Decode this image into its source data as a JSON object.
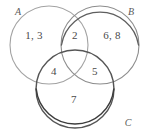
{
  "figure": {
    "type": "venn-diagram-3-set",
    "width": 148,
    "height": 134,
    "background_color": "#ffffff"
  },
  "sets": [
    {
      "name": "set-a",
      "label": "A",
      "label_x": 18,
      "label_y": 11,
      "cx": 49,
      "cy": 45,
      "r": 39,
      "stroke_color": "#a3a3a3",
      "stroke_width": 1.1
    },
    {
      "name": "set-b",
      "label": "B",
      "label_x": 131,
      "label_y": 11,
      "cx": 100,
      "cy": 45,
      "r": 39,
      "stroke_color": "#8d8d8d",
      "stroke_width": 1.1
    },
    {
      "name": "set-c",
      "label": "C",
      "label_x": 128,
      "label_y": 122,
      "cx": 75,
      "cy": 89,
      "r": 39,
      "stroke_color": "#565656",
      "stroke_width": 1.4
    }
  ],
  "regions": [
    {
      "name": "region-a-only",
      "region": "A only",
      "value": "1, 3",
      "x": 34,
      "y": 35
    },
    {
      "name": "region-a-and-b",
      "region": "A ∩ B",
      "value": "2",
      "x": 75,
      "y": 35
    },
    {
      "name": "region-b-only",
      "region": "B only",
      "value": "6, 8",
      "x": 112,
      "y": 35
    },
    {
      "name": "region-a-and-c",
      "region": "A ∩ C",
      "value": "4",
      "x": 54,
      "y": 71
    },
    {
      "name": "region-b-and-c",
      "region": "B ∩ C",
      "value": "5",
      "x": 95,
      "y": 71
    },
    {
      "name": "region-c-only",
      "region": "C only",
      "value": "7",
      "x": 74,
      "y": 99
    }
  ]
}
